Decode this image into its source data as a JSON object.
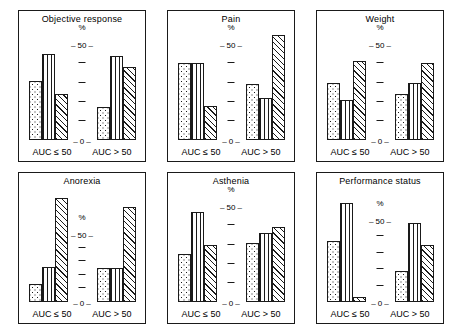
{
  "figure": {
    "axis_pct_symbol": "%",
    "group_label_left": "AUC ≤ 50",
    "group_label_right": "AUC > 50",
    "tick_label_top": "50",
    "tick_label_bottom": "0",
    "tick_dash": "–"
  },
  "chart_data": [
    {
      "type": "bar",
      "title": "Objective response",
      "ylabel": "%",
      "ylim": [
        0,
        60
      ],
      "yticks": [
        0,
        10,
        20,
        30,
        40,
        50
      ],
      "ytick_labels": [
        "0",
        "",
        "",
        "",
        "",
        "50"
      ],
      "grid": false,
      "categories": [
        "AUC ≤ 50",
        "AUC > 50"
      ],
      "series": [
        {
          "name": "bar-1-dotted",
          "pattern": "dotted",
          "values": [
            31,
            17
          ]
        },
        {
          "name": "bar-2-vertical-lines",
          "pattern": "vertical-lines",
          "values": [
            45,
            44
          ]
        },
        {
          "name": "bar-3-diagonal-hatch",
          "pattern": "diagonal-hatch",
          "values": [
            24,
            38
          ]
        }
      ]
    },
    {
      "type": "bar",
      "title": "Pain",
      "ylabel": "%",
      "ylim": [
        0,
        60
      ],
      "yticks": [
        0,
        10,
        20,
        30,
        40,
        50
      ],
      "ytick_labels": [
        "0",
        "",
        "",
        "",
        "",
        "50"
      ],
      "grid": false,
      "categories": [
        "AUC ≤ 50",
        "AUC > 50"
      ],
      "series": [
        {
          "name": "bar-1-dotted",
          "pattern": "dotted",
          "values": [
            40,
            29
          ]
        },
        {
          "name": "bar-2-vertical-lines",
          "pattern": "vertical-lines",
          "values": [
            40,
            22
          ]
        },
        {
          "name": "bar-3-diagonal-hatch",
          "pattern": "diagonal-hatch",
          "values": [
            18,
            55
          ]
        }
      ]
    },
    {
      "type": "bar",
      "title": "Weight",
      "ylabel": "%",
      "ylim": [
        0,
        60
      ],
      "yticks": [
        0,
        10,
        20,
        30,
        40,
        50
      ],
      "ytick_labels": [
        "0",
        "",
        "",
        "",
        "",
        "50"
      ],
      "grid": false,
      "categories": [
        "AUC ≤ 50",
        "AUC > 50"
      ],
      "series": [
        {
          "name": "bar-1-dotted",
          "pattern": "dotted",
          "values": [
            30,
            24
          ]
        },
        {
          "name": "bar-2-vertical-lines",
          "pattern": "vertical-lines",
          "values": [
            21,
            30
          ]
        },
        {
          "name": "bar-3-diagonal-hatch",
          "pattern": "diagonal-hatch",
          "values": [
            41,
            40
          ]
        }
      ]
    },
    {
      "type": "bar",
      "title": "Anorexia",
      "ylabel": "%",
      "ylim": [
        0,
        85
      ],
      "yticks": [
        0,
        10,
        20,
        30,
        40,
        50
      ],
      "ytick_labels": [
        "0",
        "",
        "",
        "",
        "",
        "50"
      ],
      "grid": false,
      "categories": [
        "AUC ≤ 50",
        "AUC > 50"
      ],
      "series": [
        {
          "name": "bar-1-dotted",
          "pattern": "dotted",
          "values": [
            13,
            25
          ]
        },
        {
          "name": "bar-2-vertical-lines",
          "pattern": "vertical-lines",
          "values": [
            26,
            25
          ]
        },
        {
          "name": "bar-3-diagonal-hatch",
          "pattern": "diagonal-hatch",
          "values": [
            77,
            70
          ]
        }
      ]
    },
    {
      "type": "bar",
      "title": "Asthenia",
      "ylabel": "%",
      "ylim": [
        0,
        60
      ],
      "yticks": [
        0,
        10,
        20,
        30,
        40,
        50
      ],
      "ytick_labels": [
        "0",
        "",
        "",
        "",
        "",
        "50"
      ],
      "grid": false,
      "categories": [
        "AUC ≤ 50",
        "AUC > 50"
      ],
      "series": [
        {
          "name": "bar-1-dotted",
          "pattern": "dotted",
          "values": [
            25,
            31
          ]
        },
        {
          "name": "bar-2-vertical-lines",
          "pattern": "vertical-lines",
          "values": [
            47,
            36
          ]
        },
        {
          "name": "bar-3-diagonal-hatch",
          "pattern": "diagonal-hatch",
          "values": [
            30,
            39
          ]
        }
      ]
    },
    {
      "type": "bar",
      "title": "Performance status",
      "ylabel": "%",
      "ylim": [
        0,
        70
      ],
      "yticks": [
        0,
        10,
        20,
        30,
        40,
        50
      ],
      "ytick_labels": [
        "0",
        "",
        "",
        "",
        "",
        "50"
      ],
      "grid": false,
      "categories": [
        "AUC ≤ 50",
        "AUC > 50"
      ],
      "series": [
        {
          "name": "bar-1-dotted",
          "pattern": "dotted",
          "values": [
            37,
            19
          ]
        },
        {
          "name": "bar-2-vertical-lines",
          "pattern": "vertical-lines",
          "values": [
            60,
            48
          ]
        },
        {
          "name": "bar-3-diagonal-hatch",
          "pattern": "diagonal-hatch",
          "values": [
            3,
            35
          ]
        }
      ]
    }
  ],
  "layout": {
    "panels": [
      {
        "x": 18,
        "y": 10,
        "w": 128,
        "h": 152
      },
      {
        "x": 167,
        "y": 10,
        "w": 128,
        "h": 152
      },
      {
        "x": 316,
        "y": 10,
        "w": 128,
        "h": 152
      },
      {
        "x": 18,
        "y": 172,
        "w": 128,
        "h": 152
      },
      {
        "x": 167,
        "y": 172,
        "w": 128,
        "h": 152
      },
      {
        "x": 316,
        "y": 172,
        "w": 128,
        "h": 152
      }
    ]
  }
}
